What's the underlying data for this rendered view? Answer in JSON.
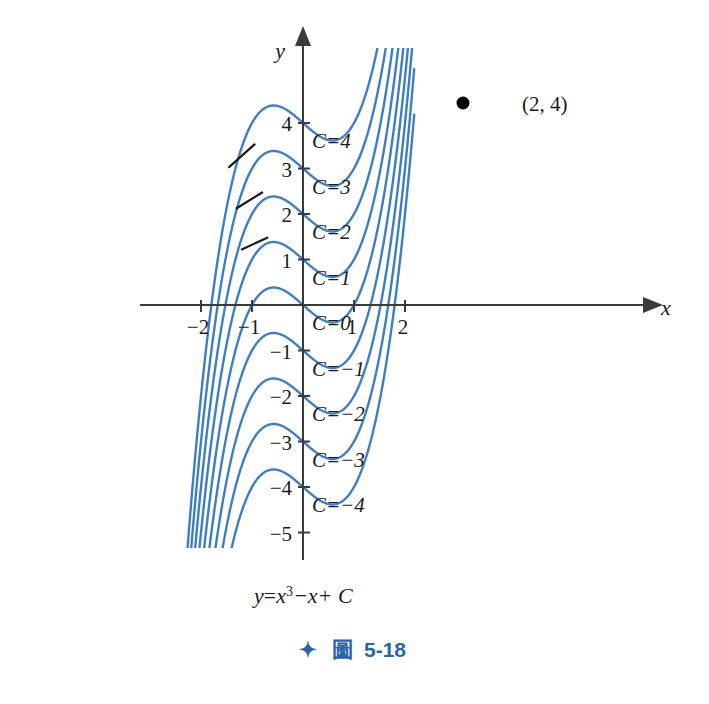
{
  "figure": {
    "equation_text": "y=x³−x+C",
    "equation_parts": {
      "lhs": "y",
      "eq": "=",
      "x": "x",
      "pow": "3",
      "minus_x": "−x",
      "plus_c": "+ C"
    },
    "caption_star": "✦",
    "caption_label": "圖",
    "caption_number": "5-18",
    "point_label": "(2, 4)",
    "axis_x_name": "x",
    "axis_y_name": "y",
    "colors": {
      "curve": "#3f7fc1",
      "axis": "#3a3a3a",
      "caption": "#2a63a8",
      "point": "#000000",
      "tangent": "#1a1a1a"
    }
  },
  "axes": {
    "x_ticks": [
      {
        "label": "−2",
        "value": -2
      },
      {
        "label": "−1",
        "value": -1
      },
      {
        "label": "1",
        "value": 1
      },
      {
        "label": "2",
        "value": 2
      }
    ],
    "y_ticks": [
      {
        "label": "4",
        "value": 4
      },
      {
        "label": "3",
        "value": 3
      },
      {
        "label": "2",
        "value": 2
      },
      {
        "label": "1",
        "value": 1
      },
      {
        "label": "−1",
        "value": -1
      },
      {
        "label": "−2",
        "value": -2
      },
      {
        "label": "−3",
        "value": -3
      },
      {
        "label": "−4",
        "value": -4
      },
      {
        "label": "−5",
        "value": -5
      }
    ]
  },
  "curve_labels": [
    {
      "text": "C=4",
      "c": 4
    },
    {
      "text": "C=3",
      "c": 3
    },
    {
      "text": "C=2",
      "c": 2
    },
    {
      "text": "C=1",
      "c": 1
    },
    {
      "text": "C=0",
      "c": 0
    },
    {
      "text": "C=−1",
      "c": -1
    },
    {
      "text": "C=−2",
      "c": -2
    },
    {
      "text": "C=−3",
      "c": -3
    },
    {
      "text": "C=−4",
      "c": -4
    }
  ],
  "chart_data": {
    "type": "line",
    "title": "",
    "xlabel": "x",
    "ylabel": "y",
    "xlim": [
      -2.35,
      2.25
    ],
    "ylim": [
      -5.4,
      5.2
    ],
    "grid": false,
    "legend": "inline-curve-labels",
    "function": "y = x^3 - x + C",
    "parameter": "C",
    "series": [
      {
        "name": "C=4",
        "c": 4,
        "y_intercept": 4
      },
      {
        "name": "C=3",
        "c": 3,
        "y_intercept": 3
      },
      {
        "name": "C=2",
        "c": 2,
        "y_intercept": 2
      },
      {
        "name": "C=1",
        "c": 1,
        "y_intercept": 1
      },
      {
        "name": "C=0",
        "c": 0,
        "y_intercept": 0
      },
      {
        "name": "C=-1",
        "c": -1,
        "y_intercept": -1
      },
      {
        "name": "C=-2",
        "c": -2,
        "y_intercept": -2
      },
      {
        "name": "C=-3",
        "c": -3,
        "y_intercept": -3
      },
      {
        "name": "C=-4",
        "c": -4,
        "y_intercept": -4
      }
    ],
    "annotations": [
      {
        "type": "point",
        "label": "(2, 4)",
        "x": 2,
        "y": 4
      },
      {
        "type": "slope-segment",
        "x": -1.2,
        "y": 3.28
      },
      {
        "type": "slope-segment",
        "x": -1.05,
        "y": 2.3
      },
      {
        "type": "slope-segment",
        "x": -0.95,
        "y": 1.35
      }
    ]
  }
}
